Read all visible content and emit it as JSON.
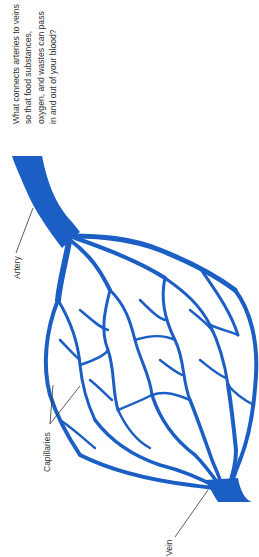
{
  "question": {
    "text": "What connects arteries to veins so that food substances, oxygen, and wastes can pass in and out of your blood?"
  },
  "labels": {
    "artery": "Artery",
    "capillaries": "Capillaries",
    "vein": "Vein"
  },
  "colors": {
    "vessel": "#1c5fc4",
    "leader_line": "#333333",
    "text": "#333333",
    "background": "#ffffff"
  }
}
